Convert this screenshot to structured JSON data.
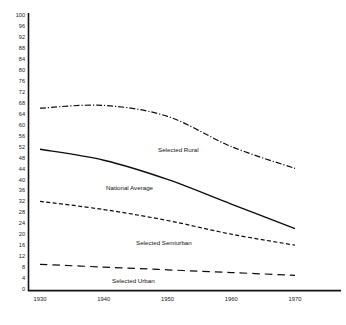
{
  "chart_data": {
    "type": "line",
    "title": "",
    "xlabel": "",
    "ylabel": "",
    "x": [
      1930,
      1940,
      1950,
      1960,
      1970
    ],
    "categories": [
      "1930",
      "1940",
      "1950",
      "1960",
      "1970"
    ],
    "xlim": [
      1930,
      1970
    ],
    "ylim": [
      0,
      100
    ],
    "grid": false,
    "legend": "inline-labels",
    "ytick_labels": [
      "0",
      "4",
      "8",
      "12",
      "16",
      "20",
      "24",
      "28",
      "32",
      "36",
      "40",
      "44",
      "48",
      "52",
      "56",
      "60",
      "64",
      "68",
      "72",
      "76",
      "80",
      "84",
      "88",
      "92",
      "96",
      "100"
    ],
    "ytick_values": [
      0,
      4,
      8,
      12,
      16,
      20,
      24,
      28,
      32,
      36,
      40,
      44,
      48,
      52,
      56,
      60,
      64,
      68,
      72,
      76,
      80,
      84,
      88,
      92,
      96,
      100
    ],
    "xtick_labels": [
      "1930",
      "1940",
      "1950",
      "1960",
      "1970"
    ],
    "series": [
      {
        "name": "Selected Rural",
        "label": "Selected Rural",
        "style": "dash-dot",
        "values": [
          66,
          67,
          63,
          52,
          44
        ]
      },
      {
        "name": "National Average",
        "label": "National Average",
        "style": "solid",
        "values": [
          51,
          47,
          40,
          31,
          22
        ]
      },
      {
        "name": "Selected Semiurban",
        "label": "Selected Semiurban",
        "style": "dashed",
        "values": [
          32,
          29,
          25,
          20,
          16
        ]
      },
      {
        "name": "Selected Urban",
        "label": "Selected Urban",
        "style": "long-dash",
        "values": [
          9,
          8,
          7,
          6,
          5
        ]
      }
    ]
  },
  "labels": {
    "rural": "Selected Rural",
    "national": "National Average",
    "semiurban": "Selected Semiurban",
    "urban": "Selected Urban"
  },
  "colors": {
    "axis": "#111111",
    "line": "#0d0d0d",
    "background": "#ffffff"
  }
}
